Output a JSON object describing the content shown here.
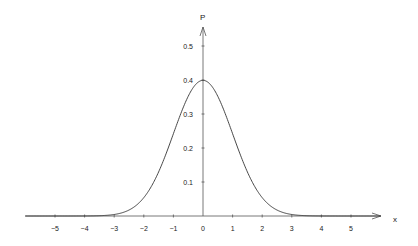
{
  "chart_data": {
    "type": "line",
    "title": "",
    "xlabel": "x",
    "ylabel": "P",
    "function": "standard normal density p(x) = exp(-x^2/2)/sqrt(2*pi)",
    "xlim": [
      -6,
      6
    ],
    "ylim": [
      0,
      0.55
    ],
    "x_ticks": [
      -5,
      -4,
      -3,
      -2,
      -1,
      0,
      1,
      2,
      3,
      4,
      5
    ],
    "x_tick_labels": [
      "−5",
      "−4",
      "−3",
      "−2",
      "−1",
      "0",
      "1",
      "2",
      "3",
      "4",
      "5"
    ],
    "y_ticks": [
      0.1,
      0.2,
      0.3,
      0.4,
      0.5
    ],
    "y_tick_labels": [
      "0.1",
      "0.2",
      "0.3",
      "0.4",
      "0.5"
    ],
    "series": [
      {
        "name": "normal density",
        "x": [
          -6,
          -5,
          -4,
          -3,
          -2.5,
          -2,
          -1.5,
          -1,
          -0.5,
          0,
          0.5,
          1,
          1.5,
          2,
          2.5,
          3,
          4,
          5,
          6
        ],
        "y": [
          0.0,
          0.0,
          0.0001,
          0.0044,
          0.0175,
          0.054,
          0.1295,
          0.242,
          0.3521,
          0.3989,
          0.3521,
          0.242,
          0.1295,
          0.054,
          0.0175,
          0.0044,
          0.0001,
          0.0,
          0.0
        ]
      }
    ],
    "grid": false,
    "legend": "none",
    "colors": {
      "curve": "#333333",
      "axes": "#555555"
    }
  }
}
